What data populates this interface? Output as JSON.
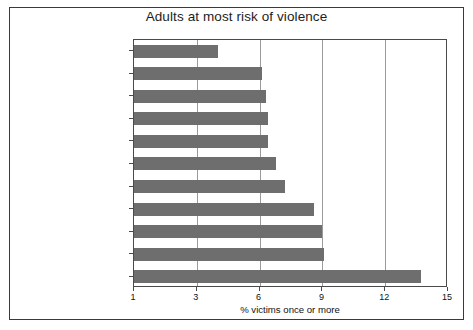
{
  "chart_data": {
    "type": "bar",
    "orientation": "horizontal",
    "title": "Adults at most risk of violence",
    "xlabel": "% victims once or more",
    "ylabel": "",
    "grid": true,
    "legend": false,
    "legend_position": "none",
    "bar_color": "#6e6e6e",
    "axis_tick_values": [
      1,
      3,
      6,
      9,
      12,
      15
    ],
    "axis_tick_labels": [
      "1",
      "3",
      "6",
      "9",
      "12",
      "15"
    ],
    "xlim": [
      1,
      15
    ],
    "note": "x tick values 1,3,6,9,12,15 are drawn at equal pixel spacing",
    "categories": [
      "All adults",
      "Separated people",
      "Men aged 25–34",
      "Private renters",
      "High physical disorder area",
      "Women aged 16–24",
      "Single adult household",
      "Single people",
      "Unemployed",
      "Full-time students",
      "Men aged 16–24"
    ],
    "values": [
      4.0,
      6.1,
      6.3,
      6.4,
      6.4,
      6.8,
      7.2,
      8.6,
      9.0,
      9.1,
      13.7
    ]
  }
}
